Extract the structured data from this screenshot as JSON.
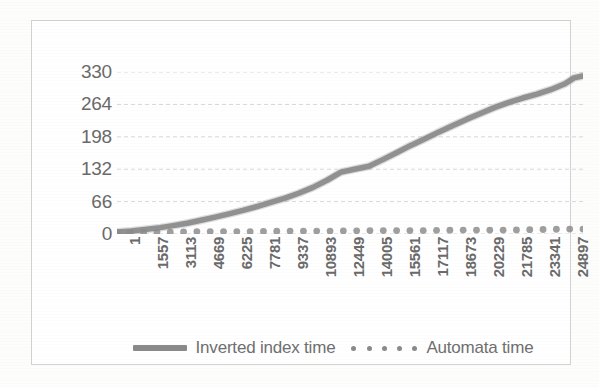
{
  "chart_data": {
    "type": "line",
    "title": "",
    "subtitle": "",
    "xlabel": "",
    "ylabel": "",
    "grid": true,
    "legend_position": "bottom",
    "ylim": [
      0,
      330
    ],
    "yticks": [
      0,
      66,
      132,
      198,
      264,
      330
    ],
    "xlim": [
      1,
      25897
    ],
    "xticks": [
      1,
      1557,
      3113,
      4669,
      6225,
      7781,
      9337,
      10893,
      12449,
      14005,
      15561,
      17117,
      18673,
      20229,
      21785,
      23341,
      24897
    ],
    "xtick_labels": [
      "1",
      "1557",
      "3113",
      "4669",
      "6225",
      "7781",
      "9337",
      "10893",
      "12449",
      "14005",
      "15561",
      "17117",
      "18673",
      "20229",
      "21785",
      "23341",
      "24897"
    ],
    "ytick_labels": [
      "0",
      "66",
      "132",
      "198",
      "264",
      "330"
    ],
    "series": [
      {
        "name": "Inverted index time",
        "style": "solid-thick-line",
        "color": "#8a8a8a",
        "x": [
          1,
          800,
          1557,
          2400,
          3113,
          3900,
          4669,
          5400,
          6225,
          7000,
          7781,
          8500,
          9337,
          10100,
          10893,
          11700,
          12449,
          13200,
          14005,
          14800,
          15561,
          16300,
          17117,
          17900,
          18673,
          19450,
          20229,
          21000,
          21785,
          22550,
          23341,
          24100,
          24897,
          25400,
          25897
        ],
        "values": [
          4,
          6,
          9,
          13,
          17,
          22,
          28,
          34,
          41,
          48,
          56,
          64,
          73,
          83,
          95,
          110,
          126,
          132,
          138,
          152,
          166,
          180,
          194,
          208,
          221,
          234,
          246,
          258,
          268,
          277,
          285,
          294,
          306,
          318,
          322
        ]
      },
      {
        "name": "Automata time",
        "style": "dotted-markers",
        "color": "#8a8a8a",
        "x": [
          1,
          1557,
          3113,
          4669,
          6225,
          7781,
          9337,
          10893,
          12449,
          14005,
          15561,
          17117,
          18673,
          20229,
          21785,
          23341,
          24897,
          25897
        ],
        "values": [
          3,
          4,
          4,
          5,
          5,
          5,
          6,
          6,
          6,
          7,
          7,
          7,
          8,
          8,
          8,
          9,
          10,
          10
        ]
      }
    ]
  },
  "legend": {
    "entries": [
      {
        "label": "Inverted index time",
        "marker": "solid-line-swatch"
      },
      {
        "label": "Automata time",
        "marker": "dotted-swatch"
      }
    ],
    "dot_count": 5
  },
  "colors": {
    "series_gray": "#8a8a8a",
    "axis_text": "#6a6a6a",
    "gridline": "#d8d8d8",
    "frame_border": "#d2d2d2",
    "background": "#ffffff"
  }
}
